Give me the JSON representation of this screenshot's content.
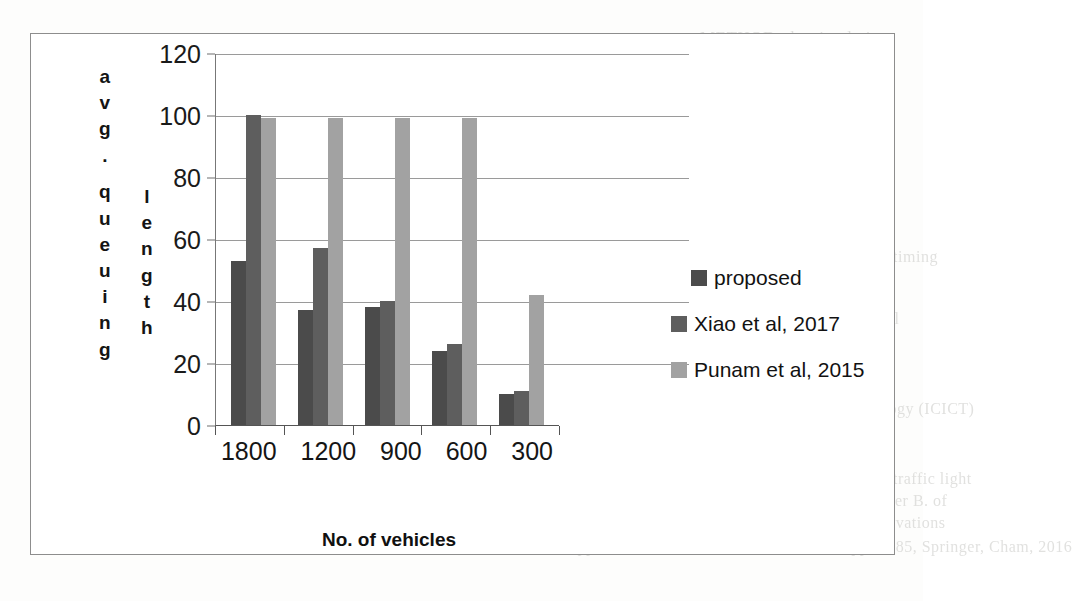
{
  "page": {
    "background_bleed_text": [
      {
        "text": "METHOD, the simulation",
        "x": 700,
        "y": 28,
        "size": 17,
        "mirror": false
      },
      {
        "text": "mulation result shows large",
        "x": 680,
        "y": 50,
        "size": 17,
        "mirror": false
      },
      {
        "text": "results.",
        "x": 790,
        "y": 72,
        "size": 17,
        "mirror": false
      },
      {
        "text": "References",
        "x": 772,
        "y": 185,
        "size": 18,
        "mirror": false
      },
      {
        "text": "A. Ferreira, J. Conte, Traffic signal timing",
        "x": 646,
        "y": 248,
        "size": 16,
        "mirror": false
      },
      {
        "text": "J. Liu, Hang W., Perna tion L., Optimal",
        "x": 628,
        "y": 310,
        "size": 16,
        "mirror": false
      },
      {
        "text": "ization in signalized , IEEE Trans",
        "x": 640,
        "y": 332,
        "size": 16,
        "mirror": false
      },
      {
        "text": "Raba, P. Gao, et al, Decentralized and",
        "x": 620,
        "y": 356,
        "size": 16,
        "mirror": false
      },
      {
        "text": "control for urban signalized networks",
        "x": 620,
        "y": 378,
        "size": 16,
        "mirror": false
      },
      {
        "text": "ble on Informatics and Communication Technology (ICICT)",
        "x": 560,
        "y": 400,
        "size": 16,
        "mirror": false
      },
      {
        "text": "China, Published, 2017",
        "x": 680,
        "y": 424,
        "size": 16,
        "mirror": false
      },
      {
        "text": "Lee K.-H., J. Kwon-K. and J.J. Gutzhuk, D. Dynamic traffic light",
        "x": 520,
        "y": 470,
        "size": 16,
        "mirror": false
      },
      {
        "text": "System: Wireless ratios among roadside units, Elsevier B. of",
        "x": 530,
        "y": 492,
        "size": 16,
        "mirror": false
      },
      {
        "text": "Ad hoc Networks, Software and Applications - in Innovations",
        "x": 520,
        "y": 514,
        "size": 16,
        "mirror": false
      },
      {
        "text": "Information Applications, IAed 2016, AISC vol. 276, pp 77-85, Springer, Cham, 2016",
        "x": 480,
        "y": 538,
        "size": 16,
        "mirror": false
      }
    ]
  },
  "chart_data": {
    "type": "bar",
    "title": "",
    "xlabel": "No. of vehicles",
    "ylabel": "avg. queuing length",
    "ylabel_column_1": "avg. queuing",
    "ylabel_column_2": "length",
    "categories": [
      "1800",
      "1200",
      "900",
      "600",
      "300"
    ],
    "ylim": [
      0,
      120
    ],
    "yticks": [
      0,
      20,
      40,
      60,
      80,
      100,
      120
    ],
    "ytick_labels": [
      "0",
      "20",
      "40",
      "60",
      "80",
      "100",
      "120"
    ],
    "grid": true,
    "legend_position": "right",
    "series": [
      {
        "name": "proposed",
        "color": "#4b4b4b",
        "values": [
          53,
          37,
          38,
          24,
          10
        ]
      },
      {
        "name": "Xiao et al, 2017",
        "color": "#5e5e5e",
        "values": [
          100,
          57,
          40,
          26,
          11
        ]
      },
      {
        "name": "Punam et al, 2015",
        "color": "#a2a2a2",
        "values": [
          99,
          99,
          99,
          99,
          42
        ]
      }
    ]
  },
  "colors": {
    "frame_border": "#8d8d8d",
    "gridline": "#9a9a9a",
    "axis": "#555555",
    "text": "#141414",
    "page_background": "#fdfdfc",
    "bleed_text": "#c9c9c6"
  }
}
